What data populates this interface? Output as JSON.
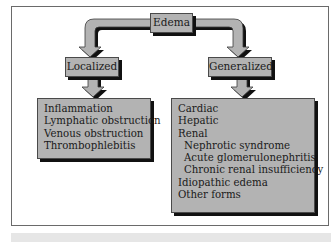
{
  "root": {
    "label": "Edema"
  },
  "branches": [
    {
      "label": "Localized",
      "items": [
        {
          "text": "Inflammation",
          "indent": false
        },
        {
          "text": "Lymphatic obstruction",
          "indent": false
        },
        {
          "text": "Venous obstruction",
          "indent": false
        },
        {
          "text": "Thrombophlebitis",
          "indent": false
        }
      ]
    },
    {
      "label": "Generalized",
      "items": [
        {
          "text": "Cardiac",
          "indent": false
        },
        {
          "text": "Hepatic",
          "indent": false
        },
        {
          "text": "Renal",
          "indent": false
        },
        {
          "text": "Nephrotic syndrome",
          "indent": true
        },
        {
          "text": "Acute glomerulonephritis",
          "indent": true
        },
        {
          "text": "Chronic renal insufficiency",
          "indent": true
        },
        {
          "text": "Idiopathic edema",
          "indent": false
        },
        {
          "text": "Other forms",
          "indent": false
        }
      ]
    }
  ],
  "colors": {
    "box_fill": "#b3b3b3",
    "shadow": "#111111",
    "frame": "#6a6a6a",
    "bottom_bar": "#e6e6e6"
  }
}
